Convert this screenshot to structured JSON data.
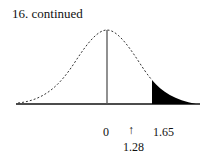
{
  "title": "16.  continued",
  "diagram": {
    "type": "normal-curve",
    "shaded_region": "right tail beyond 1.65",
    "labels": {
      "zero": "0",
      "arrow": "↑",
      "z_high": "1.65",
      "z_marked": "1.28"
    }
  }
}
